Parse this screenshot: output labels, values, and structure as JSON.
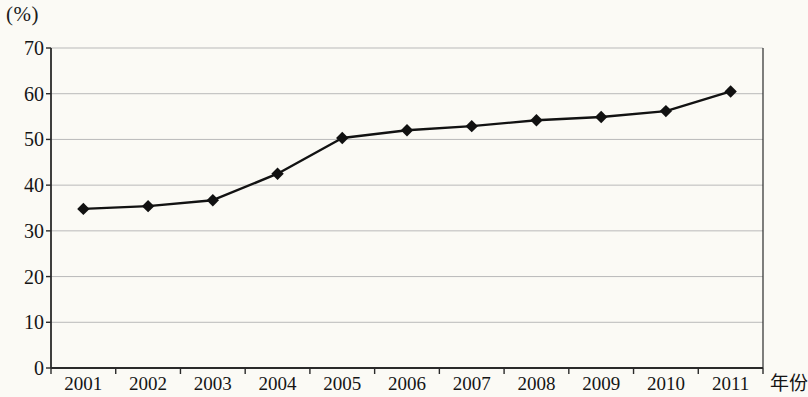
{
  "axes": {
    "unit_label": "(%)",
    "x_axis_name": "年份",
    "y_ticks": [
      "0",
      "10",
      "20",
      "30",
      "40",
      "50",
      "60",
      "70"
    ],
    "x_ticks": [
      "2001",
      "2002",
      "2003",
      "2004",
      "2005",
      "2006",
      "2007",
      "2008",
      "2009",
      "2010",
      "2011"
    ]
  },
  "style": {
    "line_color": "#121212",
    "marker_color": "#111111",
    "grid_color": "#b9b9b9",
    "frame_color": "#2a2a2a",
    "background": "#fbfaf5"
  },
  "chart_data": {
    "type": "line",
    "title": "",
    "xlabel": "年份",
    "ylabel": "(%)",
    "categories": [
      "2001",
      "2002",
      "2003",
      "2004",
      "2005",
      "2006",
      "2007",
      "2008",
      "2009",
      "2010",
      "2011"
    ],
    "values": [
      34.8,
      35.4,
      36.7,
      42.5,
      50.3,
      52.0,
      52.9,
      54.2,
      54.9,
      56.2,
      60.5
    ],
    "ylim": [
      0,
      70
    ],
    "ytick_step": 10,
    "grid": true,
    "legend": "none",
    "marker": "diamond"
  }
}
